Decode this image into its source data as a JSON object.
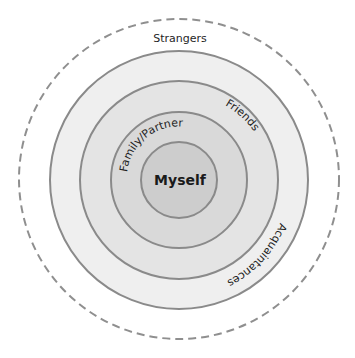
{
  "diagram": {
    "layers": [
      {
        "id": "strangers",
        "label": "Strangers",
        "style": "dashed",
        "fill": "#ffffff",
        "stroke": "#8f8f8f"
      },
      {
        "id": "acquaintances",
        "label": "Acquaintances",
        "style": "solid",
        "fill": "#efefef",
        "stroke": "#8a8a8a"
      },
      {
        "id": "friends",
        "label": "Friends",
        "style": "solid",
        "fill": "#e4e4e4",
        "stroke": "#8a8a8a"
      },
      {
        "id": "family-partner",
        "label": "Family/Partner",
        "style": "solid",
        "fill": "#d9d9d9",
        "stroke": "#8a8a8a"
      },
      {
        "id": "myself",
        "label": "Myself",
        "style": "solid",
        "fill": "#cdcdcd",
        "stroke": "#8a8a8a"
      }
    ]
  }
}
